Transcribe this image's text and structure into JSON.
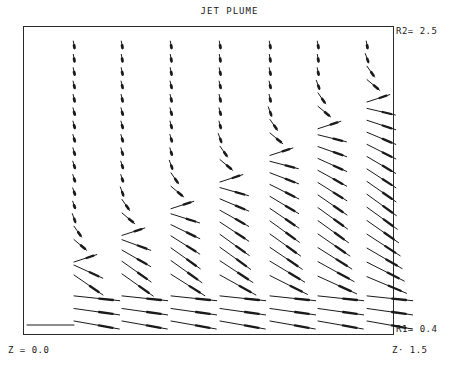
{
  "chart_data": {
    "type": "vector-field",
    "title": "JET PLUME",
    "x_axis": {
      "label_min": "Z = 0.0",
      "label_max": "Z= 1.5",
      "min": 0.0,
      "max": 1.5
    },
    "y_axis": {
      "label_min": "R1= 0.4",
      "label_max": "R2= 2.5",
      "min": 0.4,
      "max": 2.5
    },
    "frame": {
      "left": 23,
      "top": 26,
      "right": 394,
      "bottom": 335
    },
    "columns_x_px": [
      74,
      122,
      171,
      220,
      270,
      318,
      367
    ],
    "rows": {
      "top_y_px": 45,
      "bottom_y_px": 325,
      "count": 22
    },
    "turn_row_per_column": [
      16,
      14,
      12,
      10,
      8,
      6,
      4
    ],
    "baseline_segment": {
      "x1": 27,
      "y1": 325,
      "x2": 74,
      "y2": 325
    }
  },
  "labels": {
    "title": "JET PLUME",
    "r2": "R2= 2.5",
    "r1": "R1= 0.4",
    "z0": "Z = 0.0",
    "z1": "Z· 1.5"
  }
}
